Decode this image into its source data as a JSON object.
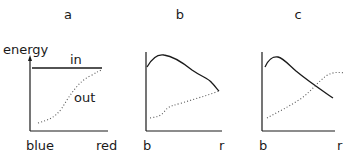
{
  "panels": [
    {
      "title": "a",
      "y_label": "energy",
      "x_start_label": "blue",
      "x_end_label": "red",
      "series": [
        {
          "name": "in",
          "style": "solid",
          "label": "in"
        },
        {
          "name": "out",
          "style": "dotted",
          "label": "out"
        }
      ]
    },
    {
      "title": "b",
      "x_start_label": "b",
      "x_end_label": "r",
      "series": [
        {
          "name": "in",
          "style": "solid"
        },
        {
          "name": "out",
          "style": "dotted"
        }
      ]
    },
    {
      "title": "c",
      "x_start_label": "b",
      "x_end_label": "r",
      "series": [
        {
          "name": "in",
          "style": "solid"
        },
        {
          "name": "out",
          "style": "dotted"
        }
      ]
    }
  ],
  "colors": {
    "ink": "#1a1a1a",
    "background": "#ffffff"
  }
}
